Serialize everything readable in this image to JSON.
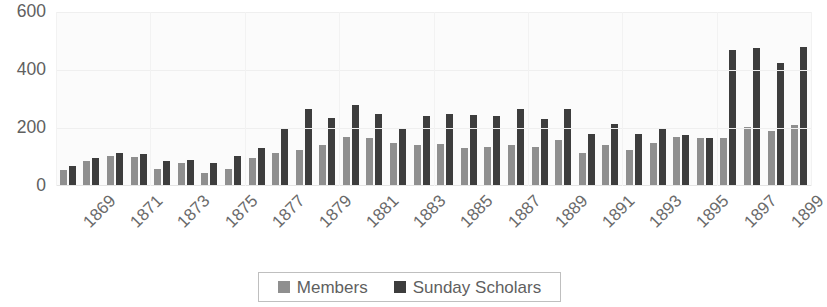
{
  "chart_data": {
    "type": "bar",
    "title": "",
    "subtitle": "",
    "xlabel": "",
    "ylabel": "",
    "ylim": [
      0,
      600
    ],
    "yticks": [
      0,
      200,
      400,
      600
    ],
    "grid": true,
    "legend_position": "bottom",
    "categories": [
      "1869",
      "1870",
      "1871",
      "1872",
      "1873",
      "1874",
      "1875",
      "1876",
      "1877",
      "1878",
      "1879",
      "1880",
      "1881",
      "1882",
      "1883",
      "1884",
      "1885",
      "1886",
      "1887",
      "1888",
      "1889",
      "1890",
      "1891",
      "1892",
      "1893",
      "1894",
      "1895",
      "1896",
      "1897",
      "1898",
      "1899",
      "1900"
    ],
    "tick_labels": [
      "1869",
      "",
      "1871",
      "",
      "1873",
      "",
      "1875",
      "",
      "1877",
      "",
      "1879",
      "",
      "1881",
      "",
      "1883",
      "",
      "1885",
      "",
      "1887",
      "",
      "1889",
      "",
      "1891",
      "",
      "1893",
      "",
      "1895",
      "",
      "1897",
      "",
      "1899",
      ""
    ],
    "series": [
      {
        "name": "Members",
        "color": "#8f8f8f",
        "values": [
          55,
          85,
          105,
          100,
          60,
          80,
          45,
          60,
          95,
          115,
          125,
          140,
          170,
          165,
          150,
          140,
          145,
          130,
          135,
          140,
          135,
          160,
          115,
          140,
          125,
          150,
          170,
          165,
          165,
          205,
          190,
          210
        ]
      },
      {
        "name": "Sunday Scholars",
        "color": "#3d3d3d",
        "values": [
          70,
          95,
          115,
          110,
          85,
          90,
          80,
          105,
          130,
          200,
          265,
          235,
          280,
          250,
          200,
          240,
          250,
          245,
          240,
          265,
          230,
          265,
          180,
          215,
          180,
          200,
          175,
          165,
          470,
          475,
          425,
          480
        ]
      }
    ]
  },
  "legend": {
    "items": [
      {
        "label": "Members",
        "swatch": "members"
      },
      {
        "label": "Sunday Scholars",
        "swatch": "scholars"
      }
    ]
  },
  "icons": {
    "members_swatch": "square-swatch-icon",
    "scholars_swatch": "square-swatch-icon"
  }
}
